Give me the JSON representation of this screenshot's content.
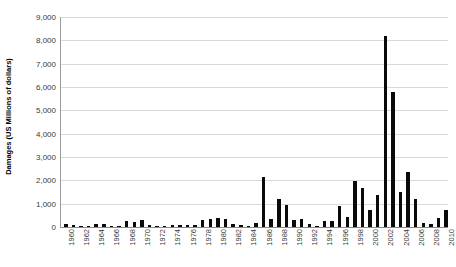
{
  "chart_data": {
    "type": "bar",
    "title": "",
    "xlabel": "",
    "ylabel": "Damages (US Millions of dollars)",
    "ylim": [
      0,
      9000
    ],
    "ytick_labels": [
      "0",
      "1,000",
      "2,000",
      "3,000",
      "4,000",
      "5,000",
      "6,000",
      "7,000",
      "8,000",
      "9,000"
    ],
    "ytick_values": [
      0,
      1000,
      2000,
      3000,
      4000,
      5000,
      6000,
      7000,
      8000,
      9000
    ],
    "grid": true,
    "legend": "none",
    "bar_color": "#0a0a0a",
    "gridline_color": "#d9d9d9",
    "axis_color": "#8a8a8a",
    "xtick_step": 2,
    "xtick_labels": [
      "1960",
      "1962",
      "1964",
      "1966",
      "1968",
      "1970",
      "1972",
      "1974",
      "1976",
      "1978",
      "1980",
      "1982",
      "1984",
      "1986",
      "1988",
      "1990",
      "1992",
      "1994",
      "1996",
      "1998",
      "2000",
      "2002",
      "2004",
      "2006",
      "2008",
      "2010"
    ],
    "categories": [
      "1960",
      "1961",
      "1962",
      "1963",
      "1964",
      "1965",
      "1966",
      "1967",
      "1968",
      "1969",
      "1970",
      "1971",
      "1972",
      "1973",
      "1974",
      "1975",
      "1976",
      "1977",
      "1978",
      "1979",
      "1980",
      "1981",
      "1982",
      "1983",
      "1984",
      "1985",
      "1986",
      "1987",
      "1988",
      "1989",
      "1990",
      "1991",
      "1992",
      "1993",
      "1994",
      "1995",
      "1996",
      "1997",
      "1998",
      "1999",
      "2000",
      "2001",
      "2002",
      "2003",
      "2004",
      "2005",
      "2006",
      "2007",
      "2008",
      "2009",
      "2010"
    ],
    "values": [
      110,
      90,
      30,
      40,
      140,
      150,
      60,
      20,
      260,
      200,
      310,
      70,
      60,
      30,
      70,
      70,
      100,
      80,
      300,
      330,
      370,
      340,
      120,
      90,
      50,
      180,
      2150,
      350,
      1220,
      940,
      320,
      360,
      130,
      30,
      240,
      270,
      880,
      430,
      1980,
      1680,
      730,
      1380,
      8200,
      5800,
      1500,
      2350,
      1180,
      190,
      120,
      380,
      750
    ]
  }
}
